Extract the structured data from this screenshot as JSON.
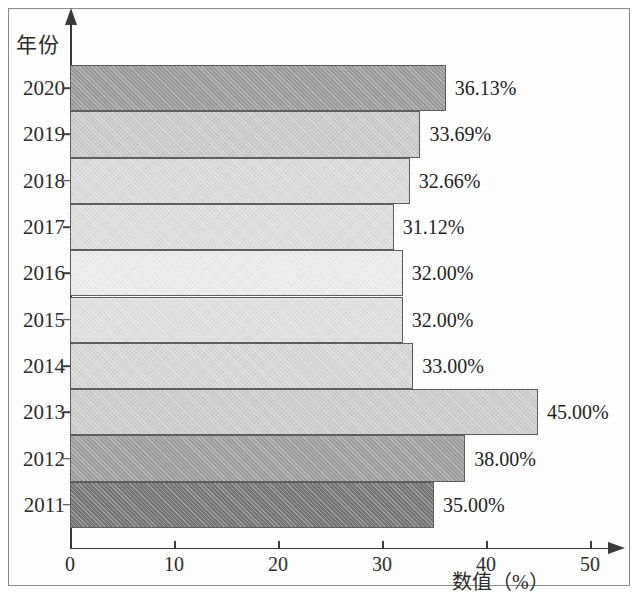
{
  "chart_data": {
    "type": "bar",
    "orientation": "horizontal",
    "title": "",
    "xlabel": "数值（%）",
    "ylabel": "年份",
    "categories": [
      "2020",
      "2019",
      "2018",
      "2017",
      "2016",
      "2015",
      "2014",
      "2013",
      "2012",
      "2011"
    ],
    "values": [
      36.13,
      33.69,
      32.66,
      31.12,
      32.0,
      32.0,
      33.0,
      45.0,
      38.0,
      35.0
    ],
    "value_labels": [
      "36.13%",
      "33.69%",
      "32.66%",
      "31.12%",
      "32.00%",
      "32.00%",
      "33.00%",
      "45.00%",
      "38.00%",
      "35.00%"
    ],
    "bar_colors": [
      "#9b9b9b",
      "#c9c9c9",
      "#d9d9d9",
      "#dddddd",
      "#ebebeb",
      "#dfdfdf",
      "#d5d5d5",
      "#cccccc",
      "#9f9f9f",
      "#767676"
    ],
    "xlim": [
      0,
      50
    ],
    "xticks": [
      0,
      10,
      20,
      30,
      40,
      50
    ],
    "xtick_labels": [
      "0",
      "10",
      "20",
      "30",
      "40",
      "50"
    ],
    "grid": false,
    "legend": null,
    "axis_color": "#3a3a3a",
    "bar_border_color": "#5e5e5e"
  },
  "axes": {
    "y_title": "年份",
    "x_title": "数值（%）"
  }
}
